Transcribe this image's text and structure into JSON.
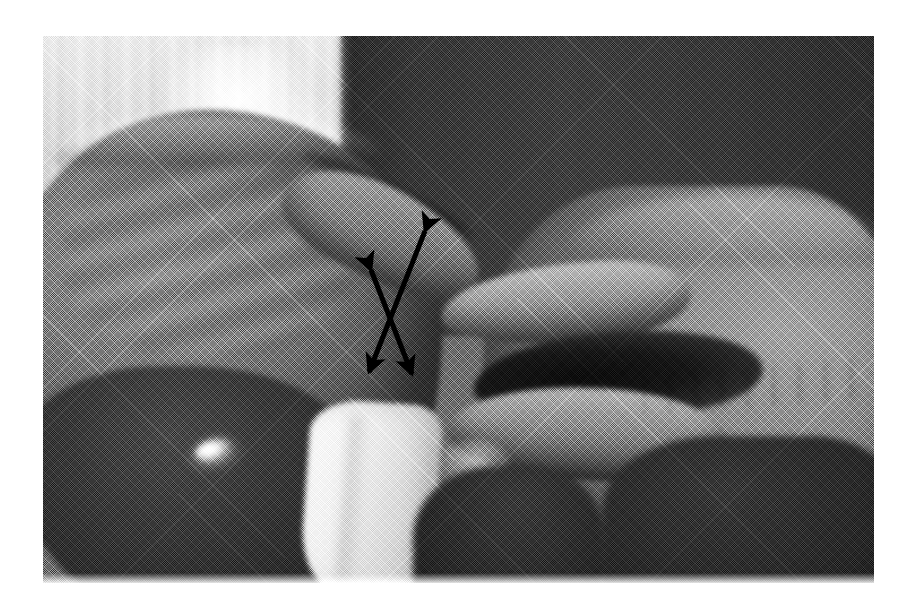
{
  "figure": {
    "kind": "halftone-grayscale-photograph",
    "caption": "",
    "page_background": "#ffffff",
    "photo": {
      "x": 43,
      "y": 36,
      "width": 831,
      "height": 547,
      "color_mode": "grayscale",
      "print_style": "halftone dot screen",
      "description": "Close-up of two hands: a clinician's left hand supporting while the right hand's fingers grasp, with crossed double-headed arrows indicating opposing shear directions.",
      "tones": {
        "highlight": "#f4f4f4",
        "curtain_light": "#c4c4c4",
        "skin_mid": "#8b8b8b",
        "wall_dark": "#3a3a3a",
        "shadow_deep": "#1b1b1b"
      }
    },
    "regions": [
      {
        "name": "light-curtain-background",
        "tone": "#c4c4c4"
      },
      {
        "name": "dark-wall-background",
        "tone": "#3a3a3a"
      },
      {
        "name": "left-hand",
        "tone": "#7b7b7b"
      },
      {
        "name": "right-hand",
        "tone": "#8b8b8b"
      },
      {
        "name": "white-shirt-cuff",
        "tone": "#eaeaea"
      },
      {
        "name": "ring-highlight",
        "tone": "#ffffff"
      }
    ],
    "annotations": {
      "count": 2,
      "color": "#000000",
      "stroke_width": 5,
      "arrows": [
        {
          "name": "arrow-upper-right-to-lower-left",
          "style": "double-headed",
          "from": {
            "x": 425,
            "y": 231
          },
          "to": {
            "x": 369,
            "y": 372
          },
          "meaning": "shear direction one"
        },
        {
          "name": "arrow-upper-left-to-lower-right",
          "style": "double-headed",
          "from": {
            "x": 371,
            "y": 270
          },
          "to": {
            "x": 412,
            "y": 374
          },
          "meaning": "shear direction two"
        }
      ],
      "crossing_point": {
        "x": 391,
        "y": 314
      }
    }
  }
}
